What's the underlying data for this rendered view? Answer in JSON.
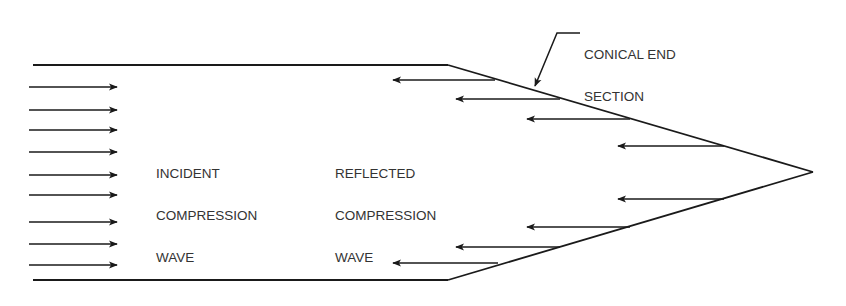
{
  "diagram": {
    "labels": {
      "conical_end": [
        "CONICAL END",
        "SECTION"
      ],
      "incident": [
        "INCIDENT",
        "COMPRESSION",
        "WAVE"
      ],
      "reflected": [
        "REFLECTED",
        "COMPRESSION",
        "WAVE"
      ]
    },
    "stroke_color": "#1a1a1a",
    "text_color": "#333333",
    "incident_arrow_ys": [
      87,
      110,
      130,
      152,
      175,
      195,
      222,
      244,
      265
    ],
    "reflected_arrows": [
      {
        "y": 80,
        "x1": 393,
        "x2": 495
      },
      {
        "y": 99,
        "x1": 456,
        "x2": 560
      },
      {
        "y": 119,
        "x1": 527,
        "x2": 630
      },
      {
        "y": 146,
        "x1": 618,
        "x2": 724
      },
      {
        "y": 199,
        "x1": 618,
        "x2": 724
      },
      {
        "y": 227,
        "x1": 527,
        "x2": 630
      },
      {
        "y": 247,
        "x1": 456,
        "x2": 560
      },
      {
        "y": 263,
        "x1": 393,
        "x2": 498
      }
    ]
  }
}
